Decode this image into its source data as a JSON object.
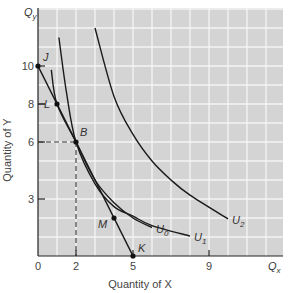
{
  "chart_data": {
    "type": "line",
    "title": "",
    "xlabel": "Quantity of X",
    "ylabel": "Quantity of Y",
    "x_axis_symbol": "Q",
    "x_axis_symbol_sub": "x",
    "y_axis_symbol": "Q",
    "y_axis_symbol_sub": "y",
    "xlim": [
      0,
      12.9
    ],
    "ylim": [
      0,
      13
    ],
    "grid": true,
    "x_ticks": [
      0,
      2,
      5,
      9
    ],
    "y_ticks": [
      3,
      6,
      8,
      10
    ],
    "x_tick_labels": [
      "0",
      "2",
      "5",
      "9"
    ],
    "y_tick_labels": [
      "3",
      "6",
      "8",
      "10"
    ],
    "series": [
      {
        "name": "budget line JK",
        "kind": "line",
        "points": [
          [
            0,
            10
          ],
          [
            5,
            0
          ]
        ]
      },
      {
        "name": "U0",
        "label": "U",
        "sub": "0",
        "kind": "indifference",
        "points": [
          [
            0.7,
            9.8
          ],
          [
            1,
            8
          ],
          [
            2,
            6
          ],
          [
            3,
            4
          ],
          [
            4,
            2.8
          ],
          [
            5,
            2
          ],
          [
            6,
            1.5
          ]
        ]
      },
      {
        "name": "U1",
        "label": "U",
        "sub": "1",
        "kind": "indifference",
        "points": [
          [
            1.1,
            11.5
          ],
          [
            1.5,
            8.6
          ],
          [
            2,
            6
          ],
          [
            3,
            3.8
          ],
          [
            4,
            2.6
          ],
          [
            5,
            2.1
          ],
          [
            6,
            1.6
          ],
          [
            8,
            1.05
          ]
        ]
      },
      {
        "name": "U2",
        "label": "U",
        "sub": "2",
        "kind": "indifference",
        "points": [
          [
            3,
            12
          ],
          [
            4,
            8.4
          ],
          [
            5,
            6.4
          ],
          [
            6,
            5
          ],
          [
            7,
            4
          ],
          [
            8,
            3.2
          ],
          [
            10,
            1.95
          ]
        ]
      }
    ],
    "points": [
      {
        "label": "J",
        "x": 0,
        "y": 10
      },
      {
        "label": "L",
        "x": 1,
        "y": 8
      },
      {
        "label": "B",
        "x": 2,
        "y": 6
      },
      {
        "label": "M",
        "x": 4,
        "y": 2
      },
      {
        "label": "K",
        "x": 5,
        "y": 0
      }
    ],
    "guides": [
      {
        "from": [
          0,
          6
        ],
        "to": [
          2,
          6
        ],
        "style": "dashed"
      },
      {
        "from": [
          2,
          6
        ],
        "to": [
          2,
          0
        ],
        "style": "dashed"
      }
    ],
    "colors": {
      "plot_bg": "#d4d4d4",
      "grid": "#f4f4f4",
      "curve": "#1a1a1a",
      "axis": "#222222"
    }
  }
}
